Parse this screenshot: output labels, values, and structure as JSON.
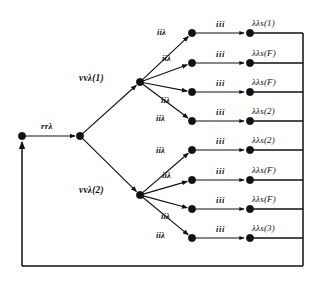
{
  "diagram": {
    "type": "directed-graph",
    "root": {
      "name": "root-node",
      "x": 22,
      "y": 136
    },
    "entry_edge": {
      "label": "rrλ",
      "from": "root-node",
      "to": "split-node"
    },
    "split": {
      "name": "split-node",
      "x": 80,
      "y": 136
    },
    "branches": [
      {
        "label": "vvλ(1)",
        "node_x": 140,
        "node_y": 82,
        "label_x": 79,
        "label_y": 74
      },
      {
        "label": "vvλ(2)",
        "node_x": 140,
        "node_y": 195,
        "label_x": 79,
        "label_y": 186
      }
    ],
    "fan_edge_label": "iiλ",
    "leaf_edge_label": "iii",
    "leaf_node_x": 192,
    "terminal_node_x": 250,
    "loop_x": 303,
    "loop_y": 266,
    "rows": [
      {
        "y": 33,
        "fan_label": "iiλ",
        "fan_label_x": 157,
        "fan_label_y": 28,
        "edge_label": "iii",
        "terminal": "λλs(1)"
      },
      {
        "y": 63,
        "fan_label": "iiλ",
        "fan_label_x": 162,
        "fan_label_y": 54,
        "edge_label": "iii",
        "terminal": "λλs(F)"
      },
      {
        "y": 92,
        "fan_label": "iiλ",
        "fan_label_x": 161,
        "fan_label_y": 96,
        "edge_label": "iii",
        "terminal": "λλs(F)"
      },
      {
        "y": 121,
        "fan_label": "iiλ",
        "fan_label_x": 156,
        "fan_label_y": 114,
        "edge_label": "iii",
        "terminal": "λλs(2)"
      },
      {
        "y": 150,
        "fan_label": "iiλ",
        "fan_label_x": 156,
        "fan_label_y": 146,
        "edge_label": "iii",
        "terminal": "λλs(2)"
      },
      {
        "y": 180,
        "fan_label": "iiλ",
        "fan_label_x": 162,
        "fan_label_y": 171,
        "edge_label": "iii",
        "terminal": "λλs(F)"
      },
      {
        "y": 209,
        "fan_label": "iiλ",
        "fan_label_x": 161,
        "fan_label_y": 212,
        "edge_label": "iii",
        "terminal": "λλs(F)"
      },
      {
        "y": 238,
        "fan_label": "iiλ",
        "fan_label_x": 156,
        "fan_label_y": 231,
        "edge_label": "iii",
        "terminal": "λλs(3)"
      }
    ],
    "colors": {
      "ink": "#111111",
      "background": "#ffffff"
    }
  }
}
